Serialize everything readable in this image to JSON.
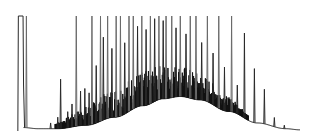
{
  "chart_data": {
    "type": "line",
    "title": "",
    "xlabel": "",
    "ylabel": "",
    "axes_visible": false,
    "grid": false,
    "legend": "none",
    "xlim": [
      0,
      100
    ],
    "ylim": [
      0,
      100
    ],
    "solvent_peak": {
      "start": 1.0,
      "end": 3.0,
      "height": 100
    },
    "baseline_hump": {
      "x": [
        3,
        8,
        15,
        25,
        35,
        45,
        52,
        58,
        65,
        75,
        85,
        95,
        100
      ],
      "y": [
        3,
        2,
        2,
        5,
        12,
        22,
        28,
        30,
        27,
        17,
        7,
        2,
        1
      ]
    },
    "peaks": [
      {
        "x": 4.0,
        "height": 100
      },
      {
        "x": 12.5,
        "height": 5
      },
      {
        "x": 15.0,
        "height": 10
      },
      {
        "x": 16.0,
        "height": 43
      },
      {
        "x": 18.5,
        "height": 14
      },
      {
        "x": 20.0,
        "height": 20
      },
      {
        "x": 21.5,
        "height": 100
      },
      {
        "x": 23.0,
        "height": 30
      },
      {
        "x": 24.5,
        "height": 32
      },
      {
        "x": 26.0,
        "height": 28
      },
      {
        "x": 27.0,
        "height": 100
      },
      {
        "x": 28.5,
        "height": 50
      },
      {
        "x": 30.0,
        "height": 100
      },
      {
        "x": 31.0,
        "height": 72
      },
      {
        "x": 32.5,
        "height": 100
      },
      {
        "x": 34.0,
        "height": 60
      },
      {
        "x": 35.5,
        "height": 100
      },
      {
        "x": 37.0,
        "height": 100
      },
      {
        "x": 38.5,
        "height": 62
      },
      {
        "x": 40.0,
        "height": 100
      },
      {
        "x": 41.5,
        "height": 100
      },
      {
        "x": 43.0,
        "height": 70
      },
      {
        "x": 44.5,
        "height": 100
      },
      {
        "x": 46.0,
        "height": 66
      },
      {
        "x": 47.5,
        "height": 100
      },
      {
        "x": 49.0,
        "height": 72
      },
      {
        "x": 50.5,
        "height": 100
      },
      {
        "x": 52.0,
        "height": 68
      },
      {
        "x": 53.0,
        "height": 100
      },
      {
        "x": 55.0,
        "height": 100
      },
      {
        "x": 56.5,
        "height": 60
      },
      {
        "x": 58.0,
        "height": 100
      },
      {
        "x": 60.0,
        "height": 55
      },
      {
        "x": 61.5,
        "height": 100
      },
      {
        "x": 63.5,
        "height": 100
      },
      {
        "x": 65.5,
        "height": 50
      },
      {
        "x": 67.5,
        "height": 100
      },
      {
        "x": 69.5,
        "height": 45
      },
      {
        "x": 71.5,
        "height": 100
      },
      {
        "x": 73.5,
        "height": 38
      },
      {
        "x": 76.0,
        "height": 100
      },
      {
        "x": 78.0,
        "height": 25
      },
      {
        "x": 80.5,
        "height": 74
      },
      {
        "x": 84.0,
        "height": 47
      },
      {
        "x": 87.5,
        "height": 30
      },
      {
        "x": 91.0,
        "height": 8
      },
      {
        "x": 94.5,
        "height": 3
      }
    ],
    "noise_cluster_range": [
      14,
      82
    ]
  }
}
